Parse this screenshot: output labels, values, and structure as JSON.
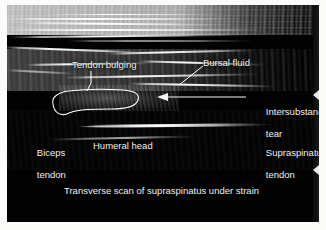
{
  "figure": {
    "kind": "musculoskeletal-ultrasound-annotated-figure",
    "caption": "Transverse scan of supraspinatus under strain",
    "background_color": "#fbfbfa",
    "scan_background_color": "#020202",
    "annotation_color": "#f2f2f2"
  },
  "annotations": {
    "tendon_bulging": {
      "label": "Tendon bulging",
      "marker": "outlined-region-with-leader-line"
    },
    "bursal_fluid": {
      "label": "Bursal fluid",
      "marker": "diagonal-leader-line"
    },
    "intersubstance_tear": {
      "label_line1": "Intersubstance",
      "label_line2": "tear",
      "marker": "horizontal-arrow-pointing-left"
    },
    "supraspinatus_tendon": {
      "label_line1": "Supraspinatus",
      "label_line2": "tendon",
      "marker": "text-only"
    },
    "biceps_tendon": {
      "label_line1": "Biceps",
      "label_line2": "tendon",
      "marker": "text-only"
    },
    "humeral_head": {
      "label": "Humeral head",
      "marker": "text-only"
    }
  },
  "depth_markers": {
    "count": 2,
    "glyph": "left-pointing-triangle",
    "color": "#e9e9e6"
  }
}
